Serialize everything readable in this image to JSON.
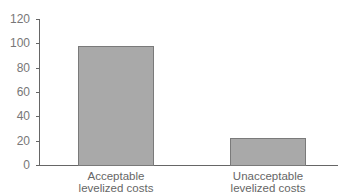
{
  "chart_data": {
    "type": "bar",
    "title": "",
    "xlabel": "",
    "ylabel": "",
    "categories": [
      "Acceptable levelized costs",
      "Unacceptable levelized costs"
    ],
    "category_lines": [
      [
        "Acceptable",
        "levelized costs"
      ],
      [
        "Unacceptable",
        "levelized costs"
      ]
    ],
    "values": [
      98,
      22
    ],
    "ylim": [
      0,
      120
    ],
    "yticks": [
      0,
      20,
      40,
      60,
      80,
      100,
      120
    ],
    "grid": false,
    "legend": null,
    "bar_color": "#a9a9a9"
  }
}
